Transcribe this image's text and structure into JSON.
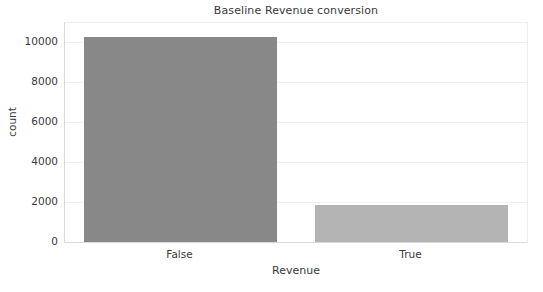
{
  "chart_data": {
    "type": "bar",
    "title": "Baseline Revenue conversion",
    "xlabel": "Revenue",
    "ylabel": "count",
    "categories": [
      "False",
      "True"
    ],
    "values": [
      10270,
      1840
    ],
    "series": [
      {
        "name": "count",
        "values": [
          10270,
          1840
        ],
        "colors": [
          "#888888",
          "#b4b4b4"
        ]
      }
    ],
    "ylim": [
      0,
      10970
    ],
    "yticks": [
      0,
      2000,
      4000,
      6000,
      8000,
      10000
    ],
    "ytick_labels": [
      "0",
      "2000",
      "4000",
      "6000",
      "8000",
      "10000"
    ],
    "grid": true,
    "grid_axis": "y",
    "legend": false,
    "legend_position": "none",
    "background_color": "#ffffff",
    "axis_color": "#d9d9d9",
    "grid_color": "#f0f0f0",
    "text_color": "#3a3a3a"
  }
}
